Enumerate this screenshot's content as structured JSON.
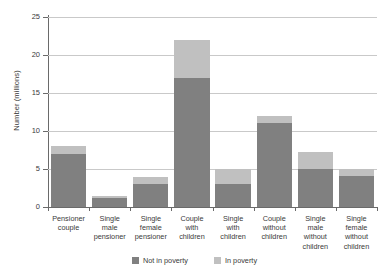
{
  "chart_data": {
    "type": "bar",
    "subtype": "stacked-vertical",
    "title": "",
    "xlabel": "",
    "ylabel": "Number (millions)",
    "ylim": [
      0,
      25
    ],
    "yticks": [
      0,
      5,
      10,
      15,
      20,
      25
    ],
    "ytick_labels": [
      "0",
      "5",
      "10",
      "15",
      "20",
      "25"
    ],
    "grid": true,
    "grid_axis": "y",
    "legend_position": "bottom-center",
    "categories": [
      "Pensioner couple",
      "Single male pensioner",
      "Single female pensioner",
      "Couple with children",
      "Single with children",
      "Couple without children",
      "Single male without children",
      "Single female without children"
    ],
    "category_lines": [
      [
        "Pensioner",
        "couple"
      ],
      [
        "Single",
        "male",
        "pensioner"
      ],
      [
        "Single",
        "female",
        "pensioner"
      ],
      [
        "Couple",
        "with",
        "children"
      ],
      [
        "Single",
        "with",
        "children"
      ],
      [
        "Couple",
        "without",
        "children"
      ],
      [
        "Single",
        "male",
        "without",
        "children"
      ],
      [
        "Single",
        "female",
        "without",
        "children"
      ]
    ],
    "series": [
      {
        "name": "Not in poverty",
        "color": "#808080",
        "values": [
          7.0,
          1.2,
          3.0,
          17.0,
          3.0,
          11.0,
          5.0,
          4.1
        ]
      },
      {
        "name": "In poverty",
        "color": "#c0c0c0",
        "values": [
          1.0,
          0.2,
          1.0,
          5.0,
          2.0,
          1.0,
          2.2,
          0.9
        ]
      }
    ],
    "totals": [
      8.0,
      1.4,
      4.0,
      22.0,
      5.0,
      12.0,
      7.2,
      5.0
    ]
  },
  "legend": {
    "items": [
      {
        "label": "Not in poverty",
        "color": "#808080"
      },
      {
        "label": "In poverty",
        "color": "#c0c0c0"
      }
    ]
  },
  "axes": {
    "y_title": "Number (millions)"
  }
}
